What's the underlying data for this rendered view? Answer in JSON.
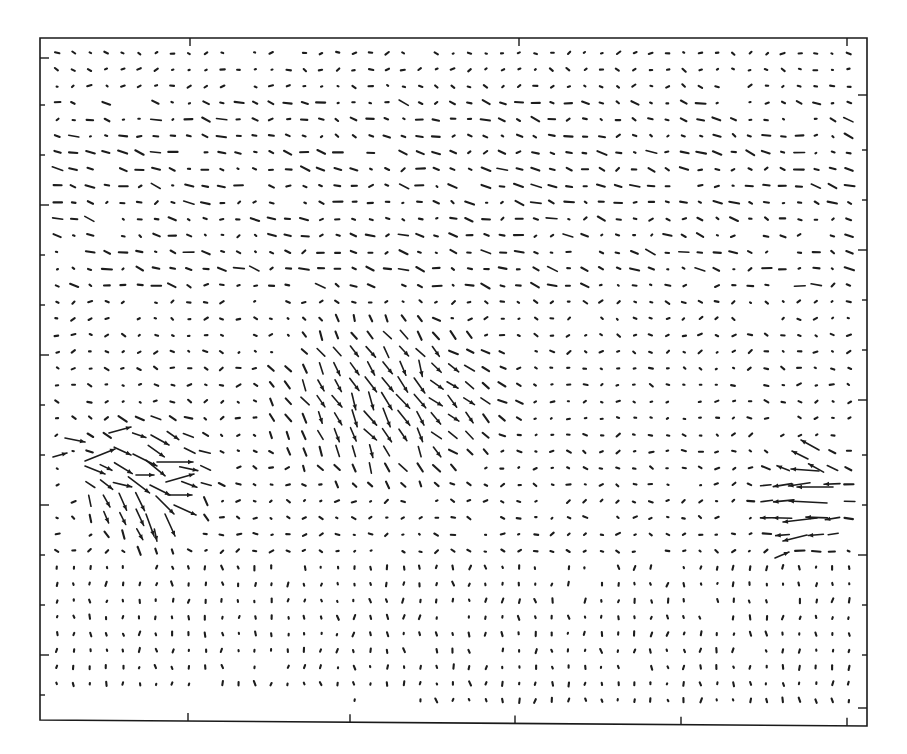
{
  "chart_data": {
    "type": "quiver",
    "title": "",
    "xlabel": "",
    "ylabel": "",
    "tick_labels_shown": false,
    "grid": false,
    "legend": null,
    "frame_px": {
      "left": 40,
      "top": 38,
      "right": 867,
      "bottom": 720,
      "bottom_right_y": 726
    },
    "x_ticks_px": [
      188,
      350,
      515,
      681,
      847
    ],
    "top_ticks_px": [
      190,
      519,
      847
    ],
    "y_ticks_left_px": [
      58,
      105,
      155,
      205,
      255,
      305,
      355,
      405,
      455,
      505,
      555,
      605,
      655,
      695
    ],
    "y_ticks_right_px": [
      95,
      150,
      200,
      250,
      300,
      350,
      400,
      455,
      505,
      555,
      605,
      655,
      708
    ],
    "grid_vectors": {
      "cols": 50,
      "rows": 40,
      "x0": 57,
      "dx": 16.5,
      "y0": 53,
      "dy": 16.6,
      "background_magnitude_px": 3.5
    },
    "features": [
      {
        "name": "left vortex / jet",
        "center_px": [
          150,
          480
        ],
        "radius_px": 75,
        "peak_len_px": 38,
        "dominant_dir": "east / south-east"
      },
      {
        "name": "central shear band",
        "center_px": [
          390,
          400
        ],
        "radius_px": 120,
        "peak_len_px": 16,
        "dominant_dir": "south-south-east"
      },
      {
        "name": "right jet",
        "center_px": [
          805,
          500
        ],
        "radius_px": 55,
        "peak_len_px": 34,
        "dominant_dir": "west"
      },
      {
        "name": "upper eastward band",
        "row_range_px": [
          100,
          300
        ],
        "peak_len_px": 8,
        "dominant_dir": "east"
      }
    ],
    "highlight_vectors": [
      {
        "x": 100,
        "y": 455,
        "u": 30,
        "v": -12
      },
      {
        "x": 120,
        "y": 430,
        "u": 22,
        "v": -6
      },
      {
        "x": 145,
        "y": 460,
        "u": 24,
        "v": 12
      },
      {
        "x": 160,
        "y": 440,
        "u": 18,
        "v": 10
      },
      {
        "x": 145,
        "y": 475,
        "u": 18,
        "v": 0
      },
      {
        "x": 175,
        "y": 462,
        "u": 36,
        "v": 0
      },
      {
        "x": 180,
        "y": 478,
        "u": 28,
        "v": -8
      },
      {
        "x": 160,
        "y": 490,
        "u": 20,
        "v": 10
      },
      {
        "x": 180,
        "y": 495,
        "u": 24,
        "v": 0
      },
      {
        "x": 165,
        "y": 505,
        "u": 18,
        "v": 18
      },
      {
        "x": 185,
        "y": 510,
        "u": 22,
        "v": 10
      },
      {
        "x": 150,
        "y": 525,
        "u": 8,
        "v": 22
      },
      {
        "x": 170,
        "y": 525,
        "u": 10,
        "v": 22
      },
      {
        "x": 95,
        "y": 470,
        "u": 20,
        "v": 8
      },
      {
        "x": 75,
        "y": 440,
        "u": 20,
        "v": 4
      },
      {
        "x": 60,
        "y": 455,
        "u": 14,
        "v": -4
      },
      {
        "x": 805,
        "y": 470,
        "u": -28,
        "v": -2
      },
      {
        "x": 815,
        "y": 487,
        "u": -36,
        "v": 0
      },
      {
        "x": 808,
        "y": 502,
        "u": -38,
        "v": -2
      },
      {
        "x": 800,
        "y": 520,
        "u": -34,
        "v": 4
      },
      {
        "x": 795,
        "y": 538,
        "u": -24,
        "v": 6
      },
      {
        "x": 810,
        "y": 445,
        "u": -18,
        "v": -10
      },
      {
        "x": 800,
        "y": 455,
        "u": -16,
        "v": -8
      },
      {
        "x": 782,
        "y": 555,
        "u": 14,
        "v": -6
      }
    ]
  }
}
